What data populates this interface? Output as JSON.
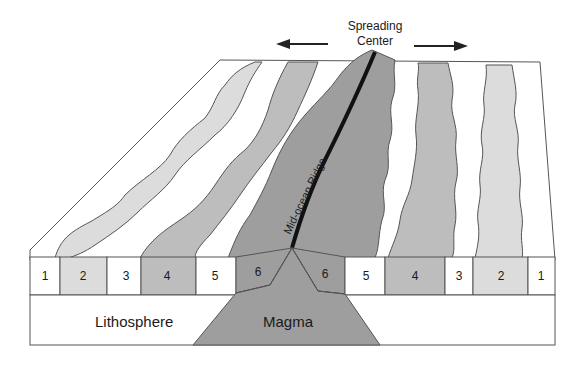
{
  "title": {
    "line1": "Spreading",
    "line2": "Center"
  },
  "arrows": {
    "left": "arrow-left",
    "right": "arrow-right"
  },
  "ridge_label": "Mid-ocean Ridge",
  "layers": {
    "lithosphere": "Lithosphere",
    "magma": "Magma"
  },
  "stripes_left": [
    "1",
    "2",
    "3",
    "4",
    "5",
    "6"
  ],
  "stripes_right": [
    "6",
    "5",
    "4",
    "3",
    "2",
    "1"
  ],
  "colors": {
    "outline": "#555555",
    "white_band": "#ffffff",
    "light_band": "#dcdcdc",
    "mid_band": "#bdbdbd",
    "dark_band": "#9e9e9e",
    "magma": "#9e9e9e",
    "ridge_line": "#111111"
  }
}
